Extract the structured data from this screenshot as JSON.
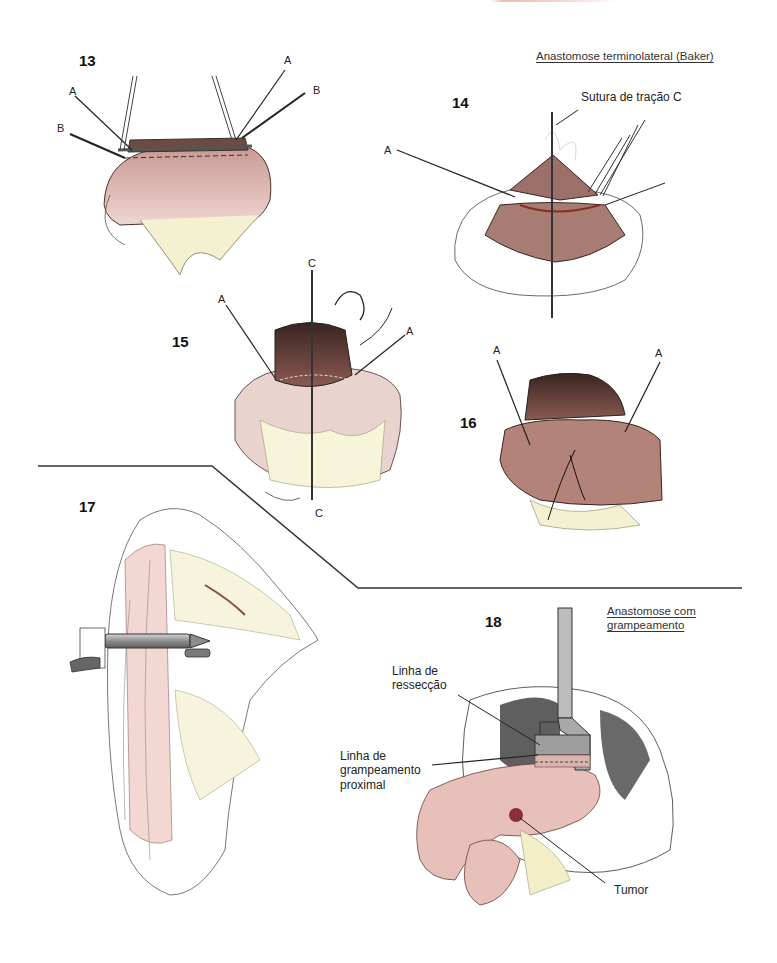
{
  "page": {
    "header_fragment_color": "#c0392b"
  },
  "sections": {
    "baker_title": "Anastomose terminolateral (Baker)",
    "stapled_title_line1": "Anastomose com",
    "stapled_title_line2": "grampeamento"
  },
  "figures": [
    {
      "number": "13",
      "labels": [
        "A",
        "A",
        "B",
        "B"
      ]
    },
    {
      "number": "14",
      "labels": [
        "A",
        "C"
      ],
      "callout": "Sutura de tração C"
    },
    {
      "number": "15",
      "labels": [
        "C",
        "A",
        "A",
        "C"
      ]
    },
    {
      "number": "16",
      "labels": [
        "A",
        "A"
      ]
    },
    {
      "number": "17",
      "labels": []
    },
    {
      "number": "18",
      "callouts": {
        "resection_line1": "Linha de",
        "resection_line2": "ressecção",
        "staple_line1": "Linha de",
        "staple_line2": "grampeamento",
        "staple_line3": "proximal",
        "tumor": "Tumor"
      }
    }
  ],
  "colors": {
    "tissue_pink": "#e8c4bf",
    "tissue_dark": "#7a4a42",
    "mesentery_yellow": "#f3f1d2",
    "instrument_gray": "#a9a9a9",
    "line": "#222222"
  }
}
